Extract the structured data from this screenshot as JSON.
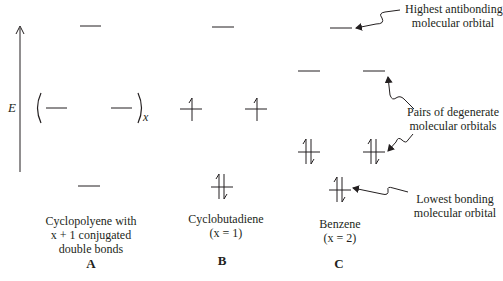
{
  "axis": {
    "label": "E"
  },
  "columns": [
    {
      "id": "A",
      "name_line1": "Cyclopolyene with",
      "name_line2": "x + 1 conjugated",
      "name_line3": "double bonds",
      "letter": "A",
      "subscript": "x"
    },
    {
      "id": "B",
      "name_line1": "Cyclobutadiene",
      "name_line2": "(x = 1)",
      "letter": "B"
    },
    {
      "id": "C",
      "name_line1": "Benzene",
      "name_line2": "(x = 2)",
      "letter": "C"
    }
  ],
  "annotations": {
    "highest": {
      "line1": "Highest antibonding",
      "line2": "molecular orbital"
    },
    "degenerate": {
      "line1": "Pairs of degenerate",
      "line2": "molecular orbitals"
    },
    "lowest": {
      "line1": "Lowest bonding",
      "line2": "molecular orbital"
    }
  },
  "colors": {
    "line": "#231f20",
    "background": "#ffffff"
  }
}
